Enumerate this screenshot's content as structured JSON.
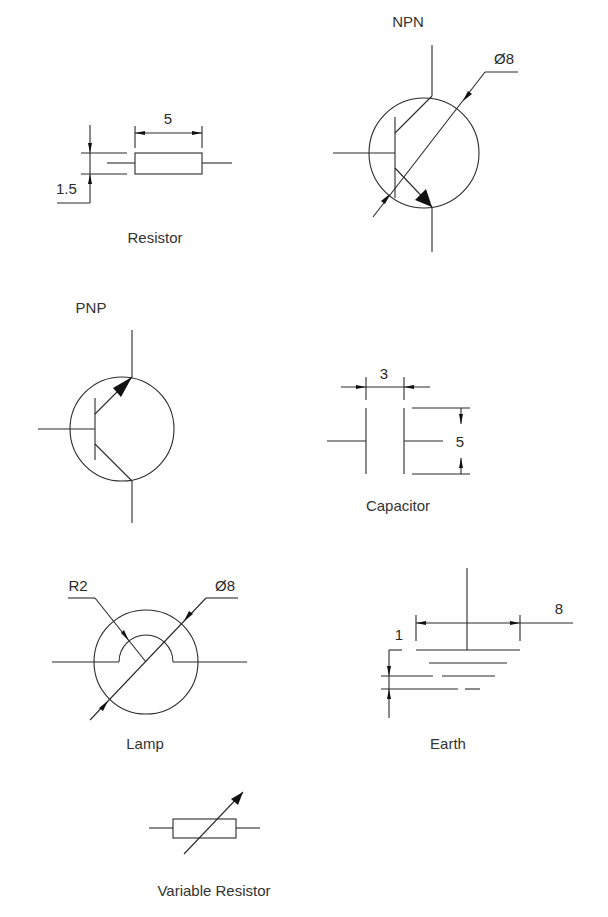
{
  "diagram": {
    "colors": {
      "line": "#2a2a2a",
      "text": "#2a2a2a",
      "background": "#ffffff"
    },
    "components": {
      "resistor": {
        "label": "Resistor",
        "dimensions": {
          "length": "5",
          "height": "1.5"
        }
      },
      "npn": {
        "label": "NPN",
        "dimensions": {
          "diameter": "Ø8"
        }
      },
      "pnp": {
        "label": "PNP"
      },
      "capacitor": {
        "label": "Capacitor",
        "dimensions": {
          "gap": "3",
          "plate_height": "5"
        }
      },
      "lamp": {
        "label": "Lamp",
        "dimensions": {
          "radius": "R2",
          "diameter": "Ø8"
        }
      },
      "earth": {
        "label": "Earth",
        "dimensions": {
          "spacing": "1",
          "width": "8"
        }
      },
      "variable_resistor": {
        "label": "Variable Resistor"
      }
    }
  }
}
